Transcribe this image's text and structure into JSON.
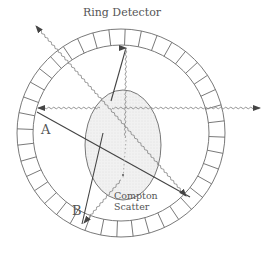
{
  "title": "Ring Detector",
  "labels": {
    "a": "A",
    "b": "B",
    "compton_line1": "Compton",
    "compton_line2": "Scatter"
  },
  "colors": {
    "line": "#4a4a4a",
    "ring": "#6a6a6a",
    "patient_fill": "#eeeeee",
    "wavy": "#8a8a8a"
  },
  "ring": {
    "center": [
      121,
      133
    ],
    "outer_radius": 104,
    "inner_radius": 88,
    "segments": 40
  }
}
